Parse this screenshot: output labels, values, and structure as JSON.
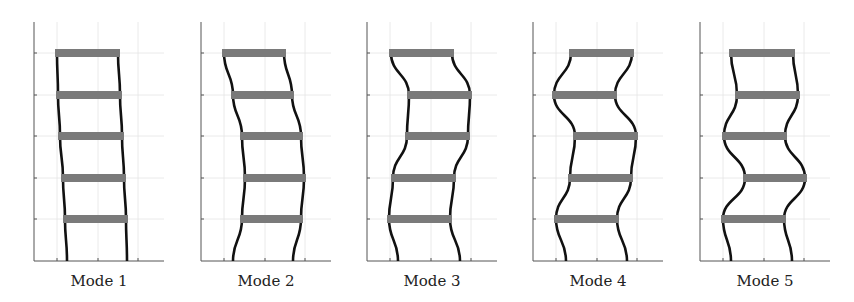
{
  "figure": {
    "type": "mode-shapes",
    "colors": {
      "column": "#111111",
      "beam": "#7a7a7a",
      "axis": "#555555",
      "grid": "#e4e4e4"
    },
    "panels": [
      {
        "label": "Mode 1",
        "origin_x": 34,
        "base": [
          67,
          127
        ],
        "floors": [
          [
            63,
            128
          ],
          [
            61,
            126
          ],
          [
            58,
            124
          ],
          [
            56,
            122
          ],
          [
            55,
            120
          ]
        ]
      },
      {
        "label": "Mode 2",
        "origin_x": 201,
        "base": [
          233,
          293
        ],
        "floors": [
          [
            240,
            303
          ],
          [
            243,
            306
          ],
          [
            240,
            303
          ],
          [
            231,
            294
          ],
          [
            222,
            286
          ]
        ]
      },
      {
        "label": "Mode 3",
        "origin_x": 367,
        "base": [
          398,
          460
        ],
        "floors": [
          [
            387,
            452
          ],
          [
            391,
            456
          ],
          [
            405,
            470
          ],
          [
            407,
            472
          ],
          [
            389,
            454
          ]
        ]
      },
      {
        "label": "Mode 4",
        "origin_x": 533,
        "base": [
          566,
          627
        ],
        "floors": [
          [
            554,
            619
          ],
          [
            568,
            633
          ],
          [
            573,
            638
          ],
          [
            552,
            617
          ],
          [
            569,
            634
          ]
        ]
      },
      {
        "label": "Mode 5",
        "origin_x": 700,
        "base": [
          731,
          792
        ],
        "floors": [
          [
            721,
            786
          ],
          [
            743,
            807
          ],
          [
            722,
            787
          ],
          [
            735,
            800
          ],
          [
            729,
            795
          ]
        ]
      }
    ],
    "floor_y": [
      219,
      178,
      136,
      95,
      53
    ],
    "axis": {
      "top_y": 22,
      "bottom_y": 261,
      "width": 130
    },
    "grid_x_offsets": [
      23,
      64,
      104
    ]
  }
}
